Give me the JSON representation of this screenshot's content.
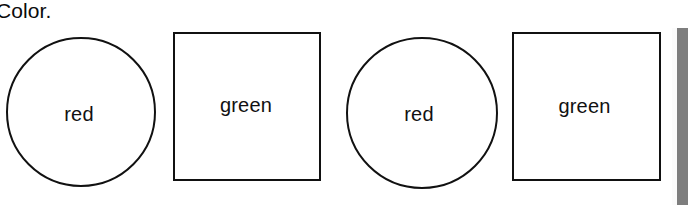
{
  "page": {
    "heading": "Color.",
    "background_color": "#ffffff",
    "ink_color": "#111111",
    "scan_edge_color": "#7e7e7e"
  },
  "shapes": [
    {
      "kind": "circle",
      "label": "red"
    },
    {
      "kind": "square",
      "label": "green"
    },
    {
      "kind": "circle",
      "label": "red"
    },
    {
      "kind": "square",
      "label": "green"
    }
  ]
}
